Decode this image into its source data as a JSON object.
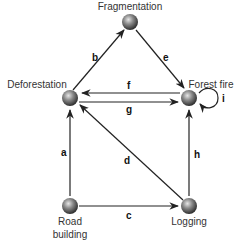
{
  "diagram": {
    "nodes": [
      {
        "id": "fragmentation",
        "label": "Fragmentation",
        "x": 130,
        "y": 22
      },
      {
        "id": "deforestation",
        "label": "Deforestation",
        "x": 70,
        "y": 98
      },
      {
        "id": "forest_fire",
        "label": "Forest fire",
        "x": 189,
        "y": 98
      },
      {
        "id": "road_building",
        "label_line1": "Road",
        "label_line2": "building",
        "x": 70,
        "y": 206
      },
      {
        "id": "logging",
        "label": "Logging",
        "x": 189,
        "y": 206
      }
    ],
    "edges": [
      {
        "label": "a",
        "from": "road_building",
        "to": "deforestation"
      },
      {
        "label": "b",
        "from": "deforestation",
        "to": "fragmentation"
      },
      {
        "label": "c",
        "from": "road_building",
        "to": "logging"
      },
      {
        "label": "d",
        "from": "logging",
        "to": "deforestation"
      },
      {
        "label": "e",
        "from": "fragmentation",
        "to": "forest_fire"
      },
      {
        "label": "f",
        "from": "forest_fire",
        "to": "deforestation"
      },
      {
        "label": "g",
        "from": "deforestation",
        "to": "forest_fire"
      },
      {
        "label": "h",
        "from": "logging",
        "to": "forest_fire"
      },
      {
        "label": "i",
        "from": "forest_fire",
        "to": "forest_fire"
      }
    ],
    "colors": {
      "edge": "#222222",
      "node_light": "#d8d8d8",
      "node_dark": "#3a3a3a"
    }
  }
}
